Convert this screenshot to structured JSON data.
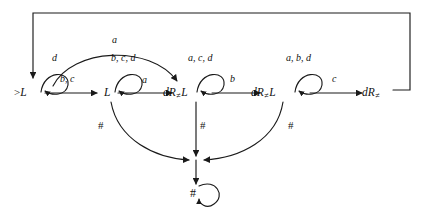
{
  "diagram": {
    "type": "state-machine",
    "stroke_color": "#1a1a1a",
    "background_color": "#ffffff",
    "states": [
      {
        "id": "s0",
        "label": "L",
        "prefix": ">",
        "subscript": "",
        "x": 34,
        "y": 93,
        "is_start": true,
        "is_sink": false
      },
      {
        "id": "s1",
        "label": "L",
        "prefix": "",
        "subscript": "",
        "x": 108,
        "y": 93,
        "is_start": false,
        "is_sink": false
      },
      {
        "id": "s2",
        "label": "dR",
        "prefix": "",
        "subscript": "≠",
        "suffix": "L",
        "x": 184,
        "y": 93,
        "is_start": false,
        "is_sink": false
      },
      {
        "id": "s3",
        "label": "dR",
        "prefix": "",
        "subscript": "≠",
        "suffix": "L",
        "x": 272,
        "y": 93,
        "is_start": false,
        "is_sink": false
      },
      {
        "id": "s4",
        "label": "dR",
        "prefix": "",
        "subscript": "≠",
        "suffix": "",
        "x": 372,
        "y": 93,
        "is_start": false,
        "is_sink": false
      },
      {
        "id": "sink",
        "label": "#",
        "prefix": "",
        "subscript": "",
        "x": 196,
        "y": 194,
        "is_start": false,
        "is_sink": true
      }
    ],
    "self_loops": [
      {
        "on": "s0",
        "label": "d",
        "label_x": 55,
        "label_y": 59
      },
      {
        "on": "s1",
        "label": "b, c, d",
        "label_x": 130,
        "label_y": 59
      },
      {
        "on": "s2",
        "label": "a, c, d",
        "label_x": 206,
        "label_y": 59
      },
      {
        "on": "s3",
        "label": "a, b, d",
        "label_x": 304,
        "label_y": 59
      },
      {
        "on": "sink",
        "label": "",
        "label_x": 0,
        "label_y": 0
      }
    ],
    "transitions": [
      {
        "from": "s0",
        "to": "s1",
        "label": "b, c",
        "label_x": 68,
        "label_y": 80,
        "kind": "straight"
      },
      {
        "from": "s0",
        "to": "s2",
        "label": "a",
        "label_x": 114,
        "label_y": 41,
        "kind": "arc-over"
      },
      {
        "from": "s1",
        "to": "s2",
        "label": "a",
        "label_x": 145,
        "label_y": 81,
        "kind": "straight"
      },
      {
        "from": "s2",
        "to": "s3",
        "label": "b",
        "label_x": 232,
        "label_y": 80,
        "kind": "straight"
      },
      {
        "from": "s3",
        "to": "s4",
        "label": "c",
        "label_x": 334,
        "label_y": 80,
        "kind": "straight"
      },
      {
        "from": "s4",
        "to": "s0",
        "label": "",
        "label_x": 0,
        "label_y": 0,
        "kind": "feedback-top"
      },
      {
        "from": "s1",
        "to": "sink",
        "label": "#",
        "label_x": 101,
        "label_y": 126,
        "kind": "arc-down-left"
      },
      {
        "from": "s2",
        "to": "sink",
        "label": "#",
        "label_x": 203,
        "label_y": 126,
        "kind": "vertical"
      },
      {
        "from": "s3",
        "to": "sink",
        "label": "#",
        "label_x": 291,
        "label_y": 126,
        "kind": "arc-down-right"
      }
    ],
    "alphabet": [
      "a",
      "b",
      "c",
      "d",
      "#"
    ],
    "notes": {
      "start_marker": ">",
      "sink_label": "#"
    }
  }
}
